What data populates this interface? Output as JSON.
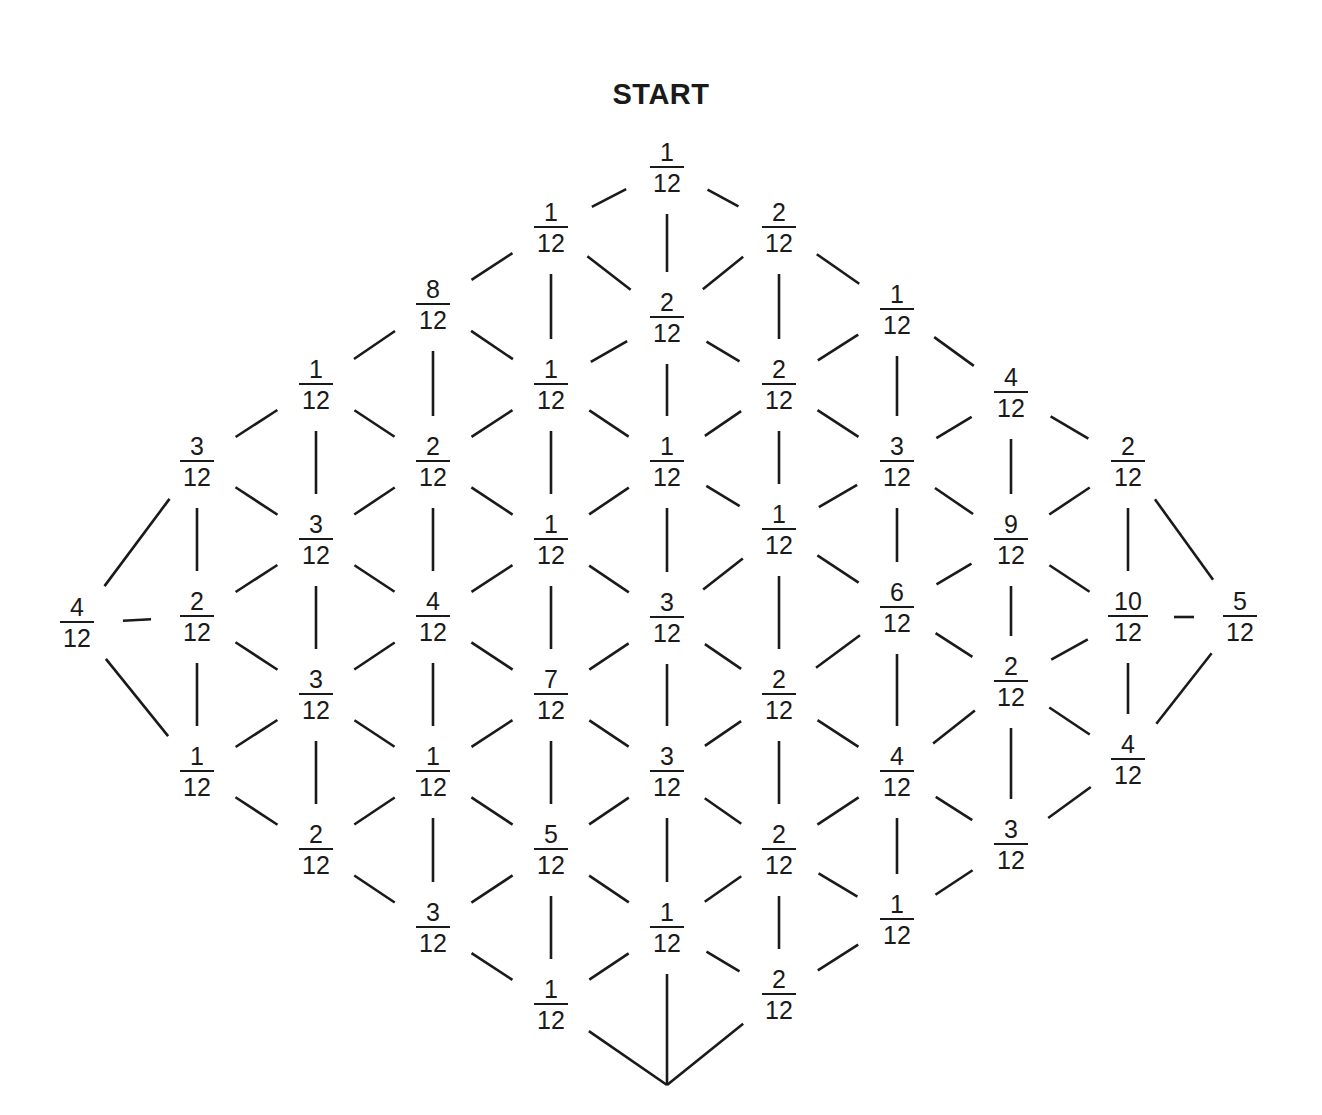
{
  "title": "START",
  "colors": {
    "ink": "#1a1a1a",
    "background": "#ffffff"
  },
  "denominator": 12,
  "nodes": [
    {
      "id": "n0",
      "x": 77,
      "y": 623,
      "num": "4",
      "den": "12"
    },
    {
      "id": "n1",
      "x": 197,
      "y": 462,
      "num": "3",
      "den": "12"
    },
    {
      "id": "n2",
      "x": 197,
      "y": 617,
      "num": "2",
      "den": "12"
    },
    {
      "id": "n3",
      "x": 197,
      "y": 772,
      "num": "1",
      "den": "12"
    },
    {
      "id": "n4",
      "x": 316,
      "y": 385,
      "num": "1",
      "den": "12"
    },
    {
      "id": "n5",
      "x": 316,
      "y": 540,
      "num": "3",
      "den": "12"
    },
    {
      "id": "n6",
      "x": 316,
      "y": 695,
      "num": "3",
      "den": "12"
    },
    {
      "id": "n7",
      "x": 316,
      "y": 850,
      "num": "2",
      "den": "12"
    },
    {
      "id": "n8",
      "x": 433,
      "y": 305,
      "num": "8",
      "den": "12"
    },
    {
      "id": "n9",
      "x": 433,
      "y": 462,
      "num": "2",
      "den": "12"
    },
    {
      "id": "n10",
      "x": 433,
      "y": 617,
      "num": "4",
      "den": "12"
    },
    {
      "id": "n11",
      "x": 433,
      "y": 772,
      "num": "1",
      "den": "12"
    },
    {
      "id": "n12",
      "x": 433,
      "y": 928,
      "num": "3",
      "den": "12"
    },
    {
      "id": "n13",
      "x": 551,
      "y": 228,
      "num": "1",
      "den": "12"
    },
    {
      "id": "n14",
      "x": 551,
      "y": 385,
      "num": "1",
      "den": "12"
    },
    {
      "id": "n15",
      "x": 551,
      "y": 540,
      "num": "1",
      "den": "12"
    },
    {
      "id": "n16",
      "x": 551,
      "y": 695,
      "num": "7",
      "den": "12"
    },
    {
      "id": "n17",
      "x": 551,
      "y": 850,
      "num": "5",
      "den": "12"
    },
    {
      "id": "n18",
      "x": 551,
      "y": 1005,
      "num": "1",
      "den": "12"
    },
    {
      "id": "n19",
      "x": 667,
      "y": 168,
      "num": "1",
      "den": "12"
    },
    {
      "id": "n20",
      "x": 667,
      "y": 318,
      "num": "2",
      "den": "12"
    },
    {
      "id": "n21",
      "x": 667,
      "y": 462,
      "num": "1",
      "den": "12"
    },
    {
      "id": "n22",
      "x": 667,
      "y": 618,
      "num": "3",
      "den": "12"
    },
    {
      "id": "n23",
      "x": 667,
      "y": 772,
      "num": "3",
      "den": "12"
    },
    {
      "id": "n24",
      "x": 667,
      "y": 928,
      "num": "1",
      "den": "12"
    },
    {
      "id": "n25",
      "x": 779,
      "y": 228,
      "num": "2",
      "den": "12"
    },
    {
      "id": "n26",
      "x": 779,
      "y": 385,
      "num": "2",
      "den": "12"
    },
    {
      "id": "n27",
      "x": 779,
      "y": 530,
      "num": "1",
      "den": "12"
    },
    {
      "id": "n28",
      "x": 779,
      "y": 695,
      "num": "2",
      "den": "12"
    },
    {
      "id": "n29",
      "x": 779,
      "y": 850,
      "num": "2",
      "den": "12"
    },
    {
      "id": "n30",
      "x": 779,
      "y": 995,
      "num": "2",
      "den": "12"
    },
    {
      "id": "n31",
      "x": 897,
      "y": 310,
      "num": "1",
      "den": "12"
    },
    {
      "id": "n32",
      "x": 897,
      "y": 462,
      "num": "3",
      "den": "12"
    },
    {
      "id": "n33",
      "x": 897,
      "y": 608,
      "num": "6",
      "den": "12"
    },
    {
      "id": "n34",
      "x": 897,
      "y": 772,
      "num": "4",
      "den": "12"
    },
    {
      "id": "n35",
      "x": 897,
      "y": 920,
      "num": "1",
      "den": "12"
    },
    {
      "id": "n36",
      "x": 1011,
      "y": 393,
      "num": "4",
      "den": "12"
    },
    {
      "id": "n37",
      "x": 1011,
      "y": 540,
      "num": "9",
      "den": "12"
    },
    {
      "id": "n38",
      "x": 1011,
      "y": 682,
      "num": "2",
      "den": "12"
    },
    {
      "id": "n39",
      "x": 1011,
      "y": 845,
      "num": "3",
      "den": "12"
    },
    {
      "id": "n40",
      "x": 1128,
      "y": 462,
      "num": "2",
      "den": "12"
    },
    {
      "id": "n41",
      "x": 1128,
      "y": 617,
      "num": "10",
      "den": "12"
    },
    {
      "id": "n42",
      "x": 1128,
      "y": 760,
      "num": "4",
      "den": "12"
    },
    {
      "id": "n43",
      "x": 1240,
      "y": 617,
      "num": "5",
      "den": "12"
    }
  ],
  "edges": [
    [
      0,
      1
    ],
    [
      0,
      2
    ],
    [
      0,
      3
    ],
    [
      1,
      4
    ],
    [
      1,
      2
    ],
    [
      1,
      5
    ],
    [
      2,
      3
    ],
    [
      2,
      5
    ],
    [
      2,
      6
    ],
    [
      3,
      6
    ],
    [
      3,
      7
    ],
    [
      4,
      8
    ],
    [
      4,
      5
    ],
    [
      4,
      9
    ],
    [
      5,
      9
    ],
    [
      5,
      6
    ],
    [
      5,
      10
    ],
    [
      6,
      10
    ],
    [
      6,
      7
    ],
    [
      6,
      11
    ],
    [
      7,
      11
    ],
    [
      7,
      12
    ],
    [
      8,
      13
    ],
    [
      8,
      9
    ],
    [
      8,
      14
    ],
    [
      9,
      14
    ],
    [
      9,
      10
    ],
    [
      9,
      15
    ],
    [
      10,
      15
    ],
    [
      10,
      11
    ],
    [
      10,
      16
    ],
    [
      11,
      16
    ],
    [
      11,
      12
    ],
    [
      11,
      17
    ],
    [
      12,
      17
    ],
    [
      12,
      18
    ],
    [
      13,
      19
    ],
    [
      13,
      14
    ],
    [
      13,
      20
    ],
    [
      14,
      20
    ],
    [
      14,
      15
    ],
    [
      14,
      21
    ],
    [
      15,
      21
    ],
    [
      15,
      16
    ],
    [
      15,
      22
    ],
    [
      16,
      22
    ],
    [
      16,
      17
    ],
    [
      16,
      23
    ],
    [
      17,
      23
    ],
    [
      17,
      18
    ],
    [
      17,
      24
    ],
    [
      18,
      24
    ],
    [
      18,
      "bottom"
    ],
    [
      19,
      20
    ],
    [
      19,
      25
    ],
    [
      20,
      25
    ],
    [
      20,
      21
    ],
    [
      20,
      26
    ],
    [
      21,
      26
    ],
    [
      21,
      22
    ],
    [
      21,
      27
    ],
    [
      22,
      27
    ],
    [
      22,
      23
    ],
    [
      22,
      28
    ],
    [
      23,
      28
    ],
    [
      23,
      24
    ],
    [
      23,
      29
    ],
    [
      24,
      29
    ],
    [
      24,
      "bottom"
    ],
    [
      24,
      30
    ],
    [
      25,
      31
    ],
    [
      25,
      26
    ],
    [
      26,
      31
    ],
    [
      26,
      27
    ],
    [
      26,
      32
    ],
    [
      27,
      32
    ],
    [
      27,
      28
    ],
    [
      27,
      33
    ],
    [
      28,
      33
    ],
    [
      28,
      29
    ],
    [
      28,
      34
    ],
    [
      29,
      34
    ],
    [
      29,
      30
    ],
    [
      29,
      35
    ],
    [
      30,
      35
    ],
    [
      "bottom",
      30
    ],
    [
      31,
      36
    ],
    [
      31,
      32
    ],
    [
      32,
      36
    ],
    [
      32,
      33
    ],
    [
      32,
      37
    ],
    [
      33,
      37
    ],
    [
      33,
      34
    ],
    [
      33,
      38
    ],
    [
      34,
      38
    ],
    [
      34,
      35
    ],
    [
      34,
      39
    ],
    [
      35,
      39
    ],
    [
      36,
      40
    ],
    [
      36,
      37
    ],
    [
      37,
      40
    ],
    [
      37,
      38
    ],
    [
      37,
      41
    ],
    [
      38,
      41
    ],
    [
      38,
      39
    ],
    [
      38,
      42
    ],
    [
      39,
      42
    ],
    [
      40,
      41
    ],
    [
      40,
      43
    ],
    [
      41,
      43
    ],
    [
      41,
      42
    ],
    [
      42,
      43
    ]
  ],
  "bottom_terminus": {
    "x": 667,
    "y": 1085
  }
}
